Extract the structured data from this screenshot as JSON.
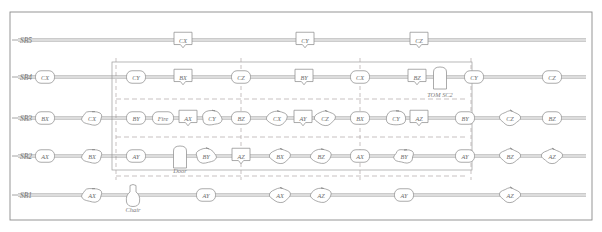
{
  "diagram": {
    "frame": {
      "outer_stroke": "#8a8a8a",
      "inner_stroke": "#9a9a9a",
      "dash_stroke": "#b0a8a8"
    },
    "rows": [
      {
        "id": "SB5",
        "label": "SB5",
        "y": 40
      },
      {
        "id": "SB4",
        "label": "SB4",
        "y": 77
      },
      {
        "id": "SB3",
        "label": "SB3",
        "y": 118
      },
      {
        "id": "SB2",
        "label": "SB2",
        "y": 156
      },
      {
        "id": "SB1",
        "label": "SB1",
        "y": 195
      }
    ],
    "annotations": [
      {
        "name": "tom-sc2",
        "text": "TOM SC2",
        "x": 440,
        "y": 94
      },
      {
        "name": "door",
        "text": "Door",
        "x": 180,
        "y": 170
      },
      {
        "name": "chair",
        "text": "Chair",
        "x": 133,
        "y": 209
      }
    ],
    "nodes": [
      {
        "row": "SB5",
        "label": "CX",
        "x": 183,
        "shape": "shield"
      },
      {
        "row": "SB5",
        "label": "CY",
        "x": 305,
        "shape": "shield"
      },
      {
        "row": "SB5",
        "label": "CZ",
        "x": 419,
        "shape": "shield"
      },
      {
        "row": "SB4",
        "label": "CX",
        "x": 45,
        "shape": "round"
      },
      {
        "row": "SB4",
        "label": "CY",
        "x": 136,
        "shape": "round"
      },
      {
        "row": "SB4",
        "label": "BX",
        "x": 183,
        "shape": "shield"
      },
      {
        "row": "SB4",
        "label": "CZ",
        "x": 241,
        "shape": "round"
      },
      {
        "row": "SB4",
        "label": "BY",
        "x": 304,
        "shape": "shield"
      },
      {
        "row": "SB4",
        "label": "CX",
        "x": 360,
        "shape": "round"
      },
      {
        "row": "SB4",
        "label": "BZ",
        "x": 417,
        "shape": "shield"
      },
      {
        "row": "SB4",
        "label": "CY",
        "x": 474,
        "shape": "round"
      },
      {
        "row": "SB4",
        "label": "CZ",
        "x": 552,
        "shape": "round"
      },
      {
        "row": "SB3",
        "label": "BX",
        "x": 45,
        "shape": "round"
      },
      {
        "row": "SB3",
        "label": "CX",
        "x": 92,
        "shape": "blob"
      },
      {
        "row": "SB3",
        "label": "BY",
        "x": 136,
        "shape": "round"
      },
      {
        "row": "SB3",
        "label": "Fire",
        "x": 163,
        "shape": "round"
      },
      {
        "row": "SB3",
        "label": "AX",
        "x": 188,
        "shape": "shield"
      },
      {
        "row": "SB3",
        "label": "CY",
        "x": 212,
        "shape": "blob"
      },
      {
        "row": "SB3",
        "label": "BZ",
        "x": 241,
        "shape": "round"
      },
      {
        "row": "SB3",
        "label": "CX",
        "x": 277,
        "shape": "blob"
      },
      {
        "row": "SB3",
        "label": "AY",
        "x": 303,
        "shape": "shield"
      },
      {
        "row": "SB3",
        "label": "CZ",
        "x": 325,
        "shape": "blob"
      },
      {
        "row": "SB3",
        "label": "BX",
        "x": 360,
        "shape": "round"
      },
      {
        "row": "SB3",
        "label": "CY",
        "x": 396,
        "shape": "blob"
      },
      {
        "row": "SB3",
        "label": "AZ",
        "x": 419,
        "shape": "shield"
      },
      {
        "row": "SB3",
        "label": "BY",
        "x": 465,
        "shape": "round"
      },
      {
        "row": "SB3",
        "label": "CZ",
        "x": 510,
        "shape": "blob"
      },
      {
        "row": "SB3",
        "label": "BZ",
        "x": 552,
        "shape": "round"
      },
      {
        "row": "SB2",
        "label": "AX",
        "x": 45,
        "shape": "round"
      },
      {
        "row": "SB2",
        "label": "BX",
        "x": 92,
        "shape": "blob"
      },
      {
        "row": "SB2",
        "label": "AY",
        "x": 136,
        "shape": "round"
      },
      {
        "row": "SB2",
        "label": "BY",
        "x": 206,
        "shape": "blob"
      },
      {
        "row": "SB2",
        "label": "AZ",
        "x": 241,
        "shape": "shield"
      },
      {
        "row": "SB2",
        "label": "BX",
        "x": 280,
        "shape": "blob"
      },
      {
        "row": "SB2",
        "label": "BZ",
        "x": 321,
        "shape": "blob"
      },
      {
        "row": "SB2",
        "label": "AX",
        "x": 360,
        "shape": "round"
      },
      {
        "row": "SB2",
        "label": "BY",
        "x": 404,
        "shape": "blob"
      },
      {
        "row": "SB2",
        "label": "AY",
        "x": 465,
        "shape": "round"
      },
      {
        "row": "SB2",
        "label": "BZ",
        "x": 510,
        "shape": "blob"
      },
      {
        "row": "SB2",
        "label": "AZ",
        "x": 552,
        "shape": "blob"
      },
      {
        "row": "SB1",
        "label": "AX",
        "x": 92,
        "shape": "blob"
      },
      {
        "row": "SB1",
        "label": "AY",
        "x": 206,
        "shape": "round"
      },
      {
        "row": "SB1",
        "label": "AX",
        "x": 280,
        "shape": "blob"
      },
      {
        "row": "SB1",
        "label": "AZ",
        "x": 321,
        "shape": "blob"
      },
      {
        "row": "SB1",
        "label": "AY",
        "x": 404,
        "shape": "round"
      },
      {
        "row": "SB1",
        "label": "AZ",
        "x": 510,
        "shape": "blob"
      }
    ],
    "special_shapes": [
      {
        "name": "tom-sc2-arch",
        "x": 440,
        "y": 78,
        "kind": "arch"
      },
      {
        "name": "door-arch",
        "x": 180,
        "y": 157,
        "kind": "arch"
      },
      {
        "name": "chair-vase",
        "x": 133,
        "y": 196,
        "kind": "vase"
      }
    ],
    "inner_region": {
      "x": 112,
      "y": 62,
      "w": 360,
      "h": 108
    },
    "outer_region": {
      "x": 10,
      "y": 12,
      "w": 582,
      "h": 208
    },
    "vertical_dashed_x": [
      116,
      241,
      360,
      471
    ],
    "horizontal_dashed_y": [
      99,
      137,
      176
    ]
  }
}
